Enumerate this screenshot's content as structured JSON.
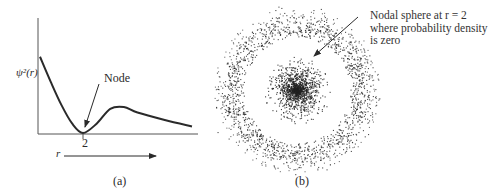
{
  "panel_a": {
    "y_label": "ψ²(r)",
    "x_label": "r",
    "node_label": "Node",
    "node_tick": "2",
    "caption": "(a)",
    "curve": {
      "description": "Radial probability density with a node at r = 2",
      "points_data_units": [
        [
          0,
          0.82
        ],
        [
          0.5,
          0.55
        ],
        [
          1.0,
          0.3
        ],
        [
          1.5,
          0.1
        ],
        [
          2.0,
          0.0
        ],
        [
          2.5,
          0.1
        ],
        [
          3.0,
          0.26
        ],
        [
          3.5,
          0.28
        ],
        [
          4.0,
          0.22
        ],
        [
          5.0,
          0.14
        ],
        [
          6.0,
          0.07
        ]
      ],
      "node_r": 2
    }
  },
  "panel_b": {
    "caption": "(b)",
    "annotation_lines": [
      "Nodal sphere at r = 2",
      "where probability density",
      "is zero"
    ],
    "dot_cloud": {
      "inner_core_relative_radius": 0.45,
      "node_relative_radius": 0.75,
      "outer_ring_relative_radius": 1.0
    }
  },
  "colors": {
    "ink": "#2a2a2a",
    "background": "#ffffff"
  }
}
